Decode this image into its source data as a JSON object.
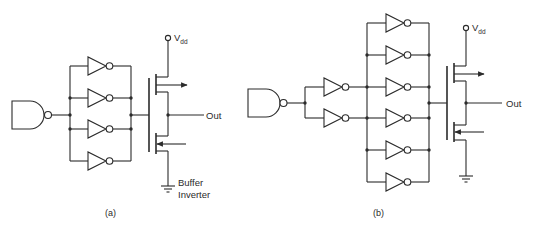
{
  "figure": {
    "panels": [
      {
        "id": "a",
        "caption": "(a)",
        "input_gate": "NAND",
        "parallel_inverters": 4,
        "supply_label": "V",
        "supply_subscript": "dd",
        "output_label": "Out",
        "annotation_line1": "Buffer",
        "annotation_line2": "Inverter"
      },
      {
        "id": "b",
        "caption": "(b)",
        "input_gate": "NAND",
        "first_stage_inverters": 2,
        "second_stage_inverters": 6,
        "supply_label": "V",
        "supply_subscript": "dd",
        "output_label": "Out"
      }
    ],
    "colors": {
      "ink": "#2b2b2b",
      "background": "#ffffff"
    }
  }
}
